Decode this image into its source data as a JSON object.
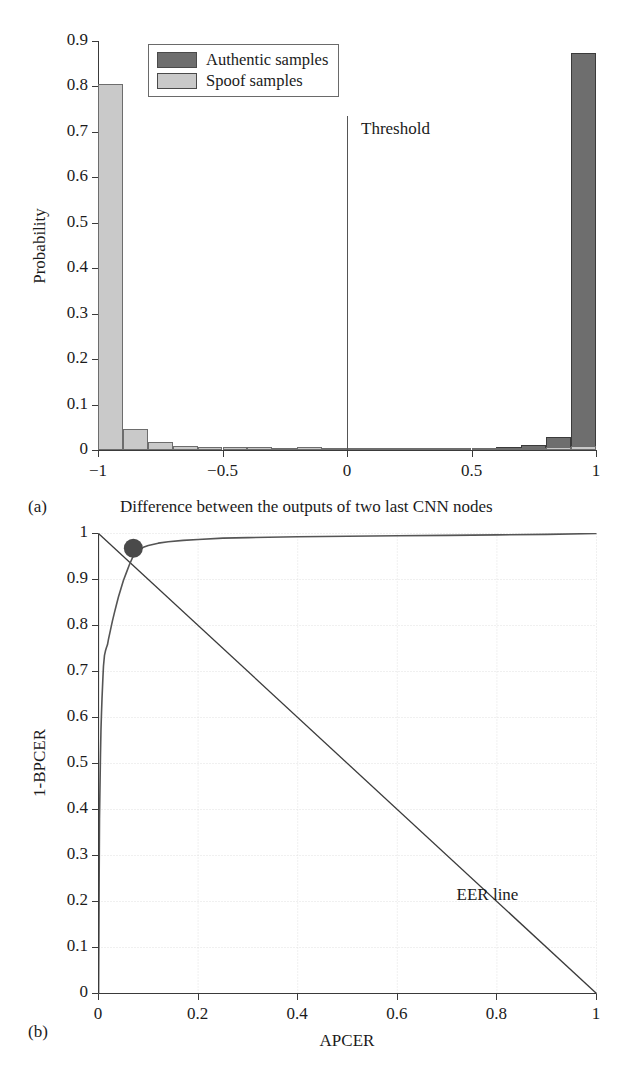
{
  "figure": {
    "clipped_header_text": "",
    "captions": {
      "a_tag": "(a)",
      "a_text": "Difference between the outputs of two last CNN nodes",
      "b_tag": "(b)"
    }
  },
  "colors": {
    "authentic": "#6e6e6e",
    "spoof": "#c9c9c9",
    "axis": "#3a3a3a",
    "curve": "#555555",
    "grid": "#d9d9d9",
    "marker": "#4a4a4a"
  },
  "chart_data": [
    {
      "id": "panel-a",
      "type": "bar",
      "title": "",
      "xlabel": "Difference between the outputs of two last CNN nodes",
      "ylabel": "Probability",
      "xlim": [
        -1,
        1
      ],
      "ylim": [
        0,
        0.9
      ],
      "grid": false,
      "xticks": [
        "-1",
        "-0.5",
        "0",
        "0.5",
        "1"
      ],
      "xtick_values": [
        -1,
        -0.5,
        0,
        0.5,
        1
      ],
      "yticks": [
        "0",
        "0.1",
        "0.2",
        "0.3",
        "0.4",
        "0.5",
        "0.6",
        "0.7",
        "0.8",
        "0.9"
      ],
      "ytick_values": [
        0,
        0.1,
        0.2,
        0.3,
        0.4,
        0.5,
        0.6,
        0.7,
        0.8,
        0.9
      ],
      "legend": {
        "position": "top-left-inside",
        "entries": [
          {
            "label": "Authentic samples",
            "color": "#6e6e6e"
          },
          {
            "label": "Spoof samples",
            "color": "#c9c9c9"
          }
        ]
      },
      "annotations": [
        {
          "name": "threshold",
          "label": "Threshold",
          "x": 0,
          "type": "vline"
        }
      ],
      "bin_edges": [
        -1.0,
        -0.9,
        -0.8,
        -0.7,
        -0.6,
        -0.5,
        -0.4,
        -0.3,
        -0.2,
        -0.1,
        0.0,
        0.1,
        0.2,
        0.3,
        0.4,
        0.5,
        0.6,
        0.7,
        0.8,
        0.9,
        1.0
      ],
      "bin_centers": [
        -0.95,
        -0.85,
        -0.75,
        -0.65,
        -0.55,
        -0.45,
        -0.35,
        -0.25,
        -0.15,
        -0.05,
        0.05,
        0.15,
        0.25,
        0.35,
        0.45,
        0.55,
        0.65,
        0.75,
        0.85,
        0.95
      ],
      "series": [
        {
          "name": "Spoof samples",
          "color": "#c9c9c9",
          "values": [
            0.805,
            0.047,
            0.017,
            0.009,
            0.006,
            0.007,
            0.006,
            0.005,
            0.006,
            0.004,
            0.002,
            0.003,
            0.003,
            0.003,
            0.003,
            0.004,
            0.004,
            0.005,
            0.007,
            0.009
          ]
        },
        {
          "name": "Authentic samples",
          "color": "#6e6e6e",
          "values": [
            0.002,
            0.002,
            0.002,
            0.002,
            0.002,
            0.002,
            0.002,
            0.002,
            0.002,
            0.002,
            0.002,
            0.003,
            0.005,
            0.005,
            0.004,
            0.005,
            0.007,
            0.011,
            0.029,
            0.873
          ]
        }
      ]
    },
    {
      "id": "panel-b",
      "type": "line",
      "title": "",
      "xlabel": "APCER",
      "ylabel": "1-BPCER",
      "xlim": [
        0,
        1
      ],
      "ylim": [
        0,
        1
      ],
      "grid": true,
      "xticks": [
        "0",
        "0.2",
        "0.4",
        "0.6",
        "0.8",
        "1"
      ],
      "xtick_values": [
        0,
        0.2,
        0.4,
        0.6,
        0.8,
        1
      ],
      "yticks": [
        "0",
        "0.1",
        "0.2",
        "0.3",
        "0.4",
        "0.5",
        "0.6",
        "0.7",
        "0.8",
        "0.9",
        "1"
      ],
      "ytick_values": [
        0,
        0.1,
        0.2,
        0.3,
        0.4,
        0.5,
        0.6,
        0.7,
        0.8,
        0.9,
        1
      ],
      "annotations": [
        {
          "name": "eer-line",
          "label": "EER line",
          "type": "diagonal",
          "from": [
            0,
            1
          ],
          "to": [
            1,
            0
          ]
        },
        {
          "name": "eer-point",
          "label": "",
          "type": "marker",
          "x": 0.07,
          "y": 0.968
        }
      ],
      "series": [
        {
          "name": "ROC",
          "color": "#555555",
          "x": [
            0.0,
            0.002,
            0.004,
            0.005,
            0.006,
            0.007,
            0.008,
            0.009,
            0.01,
            0.012,
            0.014,
            0.016,
            0.018,
            0.02,
            0.024,
            0.028,
            0.032,
            0.036,
            0.04,
            0.045,
            0.05,
            0.056,
            0.062,
            0.07,
            0.08,
            0.09,
            0.1,
            0.12,
            0.14,
            0.17,
            0.2,
            0.25,
            0.3,
            0.4,
            0.5,
            0.6,
            0.7,
            0.8,
            0.9,
            1.0
          ],
          "y": [
            0.0,
            0.38,
            0.52,
            0.575,
            0.61,
            0.64,
            0.665,
            0.69,
            0.712,
            0.735,
            0.745,
            0.752,
            0.758,
            0.77,
            0.79,
            0.81,
            0.828,
            0.845,
            0.862,
            0.88,
            0.898,
            0.915,
            0.932,
            0.952,
            0.963,
            0.97,
            0.974,
            0.979,
            0.982,
            0.985,
            0.987,
            0.99,
            0.991,
            0.993,
            0.994,
            0.995,
            0.996,
            0.997,
            0.998,
            1.0
          ]
        }
      ]
    }
  ]
}
